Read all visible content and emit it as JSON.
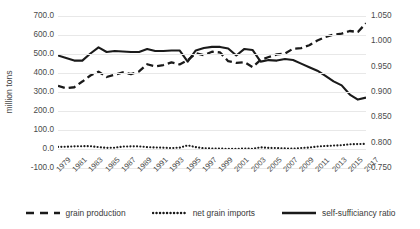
{
  "chart_data": {
    "type": "line",
    "title": "",
    "xlabel": "",
    "ylabel": "million tons",
    "ylabel_secondary": "",
    "grid": true,
    "legend_position": "bottom",
    "x": [
      1979,
      1980,
      1981,
      1982,
      1983,
      1984,
      1985,
      1986,
      1987,
      1988,
      1989,
      1990,
      1991,
      1992,
      1993,
      1994,
      1995,
      1996,
      1997,
      1998,
      1999,
      2000,
      2001,
      2002,
      2003,
      2004,
      2005,
      2006,
      2007,
      2008,
      2009,
      2010,
      2011,
      2012,
      2013,
      2014,
      2015,
      2016,
      2017
    ],
    "x_tick_labels": [
      "1979",
      "1981",
      "1983",
      "1985",
      "1987",
      "1989",
      "1991",
      "1993",
      "1995",
      "1997",
      "1999",
      "2001",
      "2003",
      "2005",
      "2007",
      "2009",
      "2011",
      "2013",
      "2015",
      "2017"
    ],
    "ylim": [
      -100,
      700
    ],
    "y_ticks": [
      -100,
      0,
      100,
      200,
      300,
      400,
      500,
      600,
      700
    ],
    "y_tick_labels": [
      "-100.0",
      "0.0",
      "100.0",
      "200.0",
      "300.0",
      "400.0",
      "500.0",
      "600.0",
      "700.0"
    ],
    "ylim_secondary": [
      0.75,
      1.05
    ],
    "y_ticks_secondary": [
      0.75,
      0.8,
      0.85,
      0.9,
      0.95,
      1.0,
      1.05
    ],
    "y_tick_labels_secondary": [
      "0.750",
      "0.800",
      "0.850",
      "0.900",
      "0.950",
      "1.000",
      "1.050"
    ],
    "series": [
      {
        "name": "grain production",
        "style": "dashed",
        "axis": "left",
        "color": "#1a1a1a",
        "values": [
          332,
          320,
          325,
          355,
          387,
          407,
          379,
          391,
          403,
          394,
          408,
          446,
          435,
          442,
          456,
          445,
          467,
          504,
          494,
          512,
          508,
          462,
          453,
          457,
          431,
          469,
          484,
          498,
          502,
          528,
          531,
          546,
          571,
          590,
          602,
          607,
          621,
          616,
          662
        ]
      },
      {
        "name": "net grain imports",
        "style": "dotted",
        "axis": "left",
        "color": "#1a1a1a",
        "values": [
          11,
          12,
          14,
          15,
          15,
          10,
          6,
          7,
          13,
          14,
          14,
          10,
          8,
          7,
          5,
          7,
          19,
          10,
          4,
          3,
          2,
          1,
          1,
          3,
          1,
          9,
          6,
          5,
          3,
          2,
          5,
          8,
          13,
          16,
          18,
          20,
          25,
          26,
          27
        ]
      },
      {
        "name": "self-sufficiancy ratio",
        "style": "solid",
        "axis": "right",
        "color": "#1a1a1a",
        "values": [
          0.972,
          0.967,
          0.962,
          0.962,
          0.976,
          0.988,
          0.979,
          0.981,
          0.98,
          0.979,
          0.979,
          0.985,
          0.981,
          0.981,
          0.982,
          0.982,
          0.96,
          0.982,
          0.987,
          0.989,
          0.989,
          0.986,
          0.972,
          0.985,
          0.983,
          0.96,
          0.963,
          0.962,
          0.965,
          0.963,
          0.956,
          0.949,
          0.942,
          0.932,
          0.921,
          0.913,
          0.895,
          0.885,
          0.889
        ]
      }
    ]
  },
  "legend": {
    "items": [
      {
        "label": "grain production",
        "style": "dashed"
      },
      {
        "label": "net grain imports",
        "style": "dotted"
      },
      {
        "label": "self-sufficiancy ratio",
        "style": "solid"
      }
    ]
  }
}
